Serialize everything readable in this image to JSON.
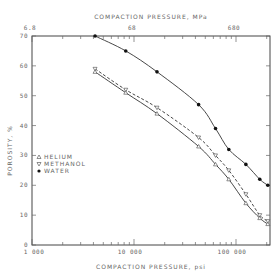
{
  "chart_data": {
    "type": "line",
    "title": "",
    "xlabel": "COMPACTION PRESSURE, psi",
    "x2label": "COMPACTION PRESSURE, MPa",
    "ylabel": "POROSITY, %",
    "xscale": "log",
    "xlim": [
      1000,
      200000
    ],
    "ylim": [
      0,
      70
    ],
    "x_ticks": [
      "1 000",
      "10 000",
      "100 000"
    ],
    "x2_ticks": [
      "6.8",
      "68",
      "680"
    ],
    "y_ticks": [
      "0",
      "10",
      "20",
      "30",
      "40",
      "50",
      "60",
      "70"
    ],
    "grid": false,
    "legend_position": "lower-left inside",
    "legend": [
      {
        "name": "HELIUM",
        "marker": "open-triangle-up"
      },
      {
        "name": "METHANOL",
        "marker": "open-triangle-down"
      },
      {
        "name": "WATER",
        "marker": "filled-circle"
      }
    ],
    "series": [
      {
        "name": "WATER",
        "line": "solid",
        "x": [
          4150,
          8300,
          16800,
          43000,
          63000,
          85000,
          125000,
          171000,
          205000
        ],
        "y": [
          70,
          65,
          58,
          47,
          39,
          32,
          27,
          22,
          20
        ]
      },
      {
        "name": "METHANOL",
        "line": "dashed",
        "x": [
          4150,
          8300,
          16800,
          43000,
          63000,
          85000,
          125000,
          171000,
          205000
        ],
        "y": [
          59,
          52,
          46,
          36,
          30,
          25,
          17,
          10,
          8
        ]
      },
      {
        "name": "HELIUM",
        "line": "solid",
        "x": [
          4150,
          8300,
          16800,
          43000,
          63000,
          85000,
          125000,
          171000,
          205000
        ],
        "y": [
          58,
          51,
          44,
          33,
          27,
          22,
          14,
          9,
          7
        ]
      }
    ]
  },
  "labels": {
    "top_axis": "COMPACTION PRESSURE, MPa",
    "bottom_axis": "COMPACTION PRESSURE, psi",
    "y_axis": "POROSITY, %",
    "legend": [
      "HELIUM",
      "METHANOL",
      "WATER"
    ]
  }
}
